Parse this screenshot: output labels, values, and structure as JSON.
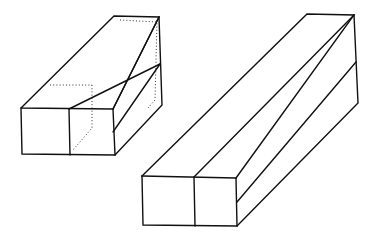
{
  "figure": {
    "left_block": {
      "label": "block with hidden edges shown dotted",
      "front_face": [
        [
          21,
          108
        ],
        [
          113,
          109
        ],
        [
          115,
          155
        ],
        [
          22,
          154
        ]
      ],
      "front_divider": [
        [
          69,
          109
        ],
        [
          70,
          155
        ]
      ],
      "back_top_left": [
        114,
        16
      ],
      "back_top_right": [
        159,
        17
      ],
      "back_bottom_right": [
        162,
        105
      ],
      "side_seam_right": [
        160,
        64
      ],
      "hidden_edges": [
        [
          [
            69,
            109
          ],
          [
            75,
            62
          ],
          [
            76,
            62
          ]
        ],
        [
          [
            50,
            62
          ],
          [
            75,
            62
          ]
        ],
        [
          [
            75,
            62
          ],
          [
            75,
            140
          ],
          [
            70,
            155
          ]
        ],
        [
          [
            159,
            17
          ],
          [
            160,
            105
          ]
        ]
      ]
    },
    "right_block": {
      "label": "solid block without hidden edges",
      "front_face": [
        [
          142,
          176
        ],
        [
          236,
          178
        ],
        [
          237,
          226
        ],
        [
          143,
          225
        ]
      ],
      "front_divider": [
        [
          194,
          177
        ],
        [
          195,
          226
        ]
      ],
      "back_top_left": [
        307,
        14
      ],
      "back_top_right": [
        354,
        15
      ],
      "back_bottom_right": [
        358,
        103
      ],
      "side_seam_right": [
        356,
        62
      ]
    },
    "colors": {
      "line": "#111111",
      "background": "#ffffff"
    }
  }
}
